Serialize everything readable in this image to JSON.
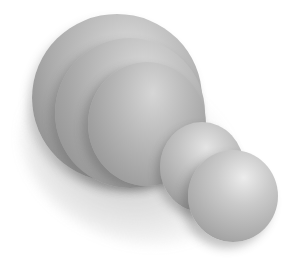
{
  "image": {
    "subject": "3D rendered grey pawn-like object lying on its side",
    "background_color": "#ffffff",
    "object_color": "#b0b0b0",
    "parts": [
      {
        "name": "dome-back",
        "description": "large rounded base dome"
      },
      {
        "name": "dome-ring",
        "description": "middle ridge band"
      },
      {
        "name": "dome-front",
        "description": "inner dome section"
      },
      {
        "name": "neck-sphere",
        "description": "small neck sphere"
      },
      {
        "name": "head-sphere",
        "description": "small head sphere"
      }
    ],
    "alt_text": "Grey 3D rendered pawn-shaped object on white background"
  }
}
